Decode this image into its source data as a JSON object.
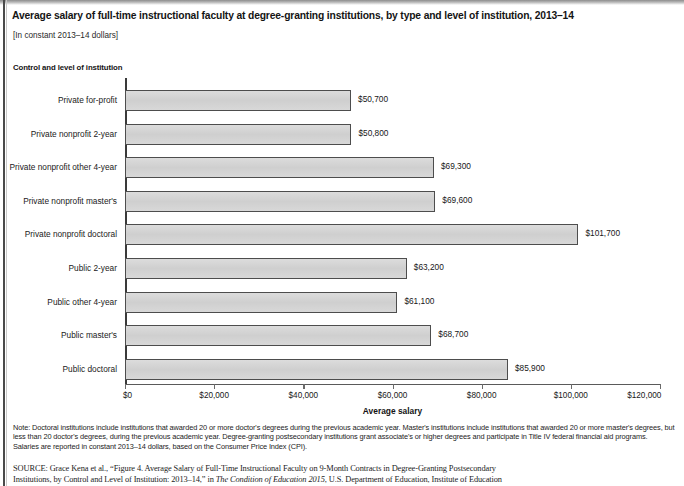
{
  "chart_title": "Average salary of full-time instructional faculty at degree-granting institutions, by type and level of institution, 2013–14",
  "chart_subtitle": "[In constant 2013–14 dollars]",
  "y_axis_group_label": "Control and level of institution",
  "chart_data": {
    "type": "bar",
    "orientation": "horizontal",
    "title": "Average salary of full-time instructional faculty at degree-granting institutions, by type and level of institution, 2013–14",
    "subtitle": "[In constant 2013–14 dollars]",
    "xlabel": "Average salary",
    "ylabel": "Control and level of institution",
    "xlim": [
      0,
      120000
    ],
    "xticks": [
      0,
      20000,
      40000,
      60000,
      80000,
      100000,
      120000
    ],
    "xtick_labels": [
      "$0",
      "$20,000",
      "$40,000",
      "$60,000",
      "$80,000",
      "$100,000",
      "$120,000"
    ],
    "grid": false,
    "legend": "none",
    "bar_fill_color": "#d6d6d6",
    "bar_border_color": "#4d4d4d",
    "categories": [
      "Private for-profit",
      "Private nonprofit 2-year",
      "Private nonprofit other 4-year",
      "Private nonprofit master's",
      "Private nonprofit doctoral",
      "Public 2-year",
      "Public other 4-year",
      "Public master's",
      "Public doctoral"
    ],
    "values": [
      50700,
      50800,
      69300,
      69600,
      101700,
      63200,
      61100,
      68700,
      85900
    ],
    "value_labels": [
      "$50,700",
      "$50,800",
      "$69,300",
      "$69,600",
      "$101,700",
      "$63,200",
      "$61,100",
      "$68,700",
      "$85,900"
    ]
  },
  "note": "Note: Doctoral institutions include institutions that awarded 20 or more doctor's degrees during the previous academic year. Master's institutions include institutions that awarded 20 or more master's degrees, but less than 20 doctor's degrees, during the previous academic year. Degree-granting postsecondary institutions grant associate's or higher degrees and participate in Title IV federal financial aid programs. Salaries are reported in constant 2013–14 dollars, based on the Consumer Price Index (CPI).",
  "source_kicker": "SOURCE:",
  "source_line1": " Grace Kena et al., “Figure 4. Average Salary of Full-Time Instructional Faculty on 9-Month Contracts in Degree-Granting Postsecondary",
  "source_line2_pre": "Institutions, by Control and Level of Institution: 2013–14,” in ",
  "source_line2_em": "The Condition of Education 2015",
  "source_line2_post": ", U.S. Department of Education, Institute of Education"
}
